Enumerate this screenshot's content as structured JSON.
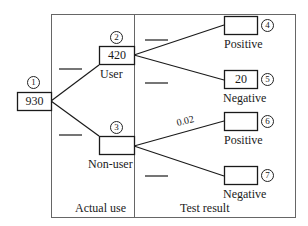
{
  "diagram": {
    "type": "probability-tree",
    "sections": {
      "left": "Actual use",
      "right": "Test result"
    },
    "nodes": [
      {
        "id": 1,
        "marker": "1",
        "value": "930",
        "label": ""
      },
      {
        "id": 2,
        "marker": "2",
        "value": "420",
        "label": "User"
      },
      {
        "id": 3,
        "marker": "3",
        "value": "",
        "label": "Non-user"
      },
      {
        "id": 4,
        "marker": "4",
        "value": "",
        "label": "Positive"
      },
      {
        "id": 5,
        "marker": "5",
        "value": "20",
        "label": "Negative"
      },
      {
        "id": 6,
        "marker": "6",
        "value": "",
        "label": "Positive"
      },
      {
        "id": 7,
        "marker": "7",
        "value": "",
        "label": "Negative"
      }
    ],
    "edges": [
      {
        "from": 1,
        "to": 2,
        "prob": ""
      },
      {
        "from": 1,
        "to": 3,
        "prob": ""
      },
      {
        "from": 2,
        "to": 4,
        "prob": ""
      },
      {
        "from": 2,
        "to": 5,
        "prob": ""
      },
      {
        "from": 3,
        "to": 6,
        "prob": "0.02"
      },
      {
        "from": 3,
        "to": 7,
        "prob": ""
      }
    ],
    "colors": {
      "line": "#1a1a1a",
      "frame": "#555555",
      "background": "#ffffff"
    }
  }
}
